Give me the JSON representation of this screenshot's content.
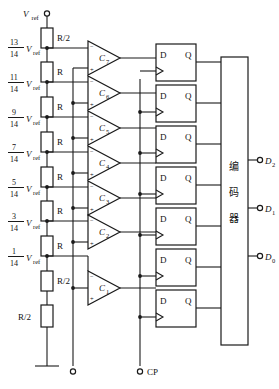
{
  "diagram": {
    "supply_label": "Vref",
    "supply_label_sub": "ref",
    "ground_name": "ground-symbol",
    "resistor_top_label": "R/2",
    "resistor_bottom_label": "R/2",
    "resistor_label": "R",
    "clock_label": "CP",
    "encoder_label": "编码器",
    "encoder_chars": [
      "编",
      "码",
      "器"
    ],
    "colors": {
      "line": "#1a1a1a",
      "fill": "#ffffff",
      "text": "#111111"
    },
    "taps": [
      {
        "numerator": "13",
        "denominator": "14",
        "symbol": "V",
        "sub": "ref"
      },
      {
        "numerator": "11",
        "denominator": "14",
        "symbol": "V",
        "sub": "ref"
      },
      {
        "numerator": "9",
        "denominator": "14",
        "symbol": "V",
        "sub": "ref"
      },
      {
        "numerator": "7",
        "denominator": "14",
        "symbol": "V",
        "sub": "ref"
      },
      {
        "numerator": "5",
        "denominator": "14",
        "symbol": "V",
        "sub": "ref"
      },
      {
        "numerator": "3",
        "denominator": "14",
        "symbol": "V",
        "sub": "ref"
      },
      {
        "numerator": "1",
        "denominator": "14",
        "symbol": "V",
        "sub": "ref"
      }
    ],
    "resistors": [
      {
        "label": "R/2"
      },
      {
        "label": "R"
      },
      {
        "label": "R"
      },
      {
        "label": "R"
      },
      {
        "label": "R"
      },
      {
        "label": "R"
      },
      {
        "label": "R"
      },
      {
        "label": "R/2"
      }
    ],
    "comparators": [
      {
        "name": "C",
        "index": "7",
        "minus": "−",
        "plus": "+"
      },
      {
        "name": "C",
        "index": "6",
        "minus": "−",
        "plus": "+"
      },
      {
        "name": "C",
        "index": "5",
        "minus": "−",
        "plus": "+"
      },
      {
        "name": "C",
        "index": "4",
        "minus": "−",
        "plus": "+"
      },
      {
        "name": "C",
        "index": "3",
        "minus": "−",
        "plus": "+"
      },
      {
        "name": "C",
        "index": "2",
        "minus": "−",
        "plus": "+"
      },
      {
        "name": "C",
        "index": "1",
        "minus": "−",
        "plus": "+"
      }
    ],
    "flipflops": [
      {
        "d": "D",
        "q": "Q"
      },
      {
        "d": "D",
        "q": "Q"
      },
      {
        "d": "D",
        "q": "Q"
      },
      {
        "d": "D",
        "q": "Q"
      },
      {
        "d": "D",
        "q": "Q"
      },
      {
        "d": "D",
        "q": "Q"
      },
      {
        "d": "D",
        "q": "Q"
      }
    ],
    "outputs": [
      {
        "symbol": "D",
        "index": "2"
      },
      {
        "symbol": "D",
        "index": "1"
      },
      {
        "symbol": "D",
        "index": "0"
      }
    ]
  }
}
